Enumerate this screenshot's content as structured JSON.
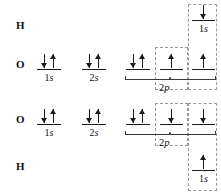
{
  "diagram": {
    "ink_color": "#1a1a1a",
    "dash_color": "#9a9a9a",
    "brace_color": "#3a3a3a",
    "background": "#ffffff"
  },
  "rows": [
    {
      "id": "h-top",
      "atom": "H"
    },
    {
      "id": "o-upper",
      "atom": "O"
    },
    {
      "id": "o-lower",
      "atom": "O"
    },
    {
      "id": "h-bottom",
      "atom": "H"
    }
  ],
  "orbitals": {
    "o_upper_1s": {
      "label_n": "1",
      "label_l": "s",
      "electrons": "down-up"
    },
    "o_upper_2s": {
      "label_n": "2",
      "label_l": "s",
      "electrons": "down-up"
    },
    "o_upper_2p_a": {
      "electrons": "down-up"
    },
    "o_upper_2p_b": {
      "electrons": "up"
    },
    "o_upper_2p_c": {
      "electrons": "up"
    },
    "o_upper_2p_set": {
      "label_n": "2",
      "label_l": "p"
    },
    "o_lower_1s": {
      "label_n": "1",
      "label_l": "s",
      "electrons": "down-up"
    },
    "o_lower_2s": {
      "label_n": "2",
      "label_l": "s",
      "electrons": "down-up"
    },
    "o_lower_2p_a": {
      "electrons": "down-up"
    },
    "o_lower_2p_b": {
      "electrons": "down"
    },
    "o_lower_2p_c": {
      "electrons": "down"
    },
    "o_lower_2p_set": {
      "label_n": "2",
      "label_l": "p"
    },
    "h_top_1s": {
      "label_n": "1",
      "label_l": "s",
      "electrons": "down"
    },
    "h_bottom_1s": {
      "label_n": "1",
      "label_l": "s",
      "electrons": "up"
    }
  },
  "bond_boxes": [
    {
      "id": "o-o-bond-box",
      "name": "oxygen-oxygen-bond-box"
    },
    {
      "id": "o-h-bond-box",
      "name": "oxygen-hydrogen-bond-box"
    }
  ]
}
